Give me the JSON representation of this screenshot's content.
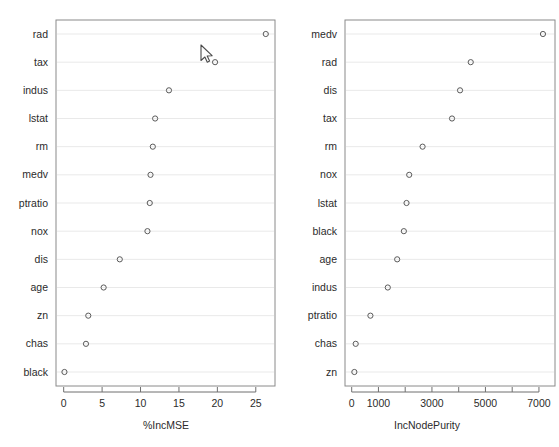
{
  "figure": {
    "type": "variable-importance-dotplot",
    "background_color": "#ffffff",
    "point_color": "#5a5a5a",
    "grid_color": "#e9e9e9",
    "axis_color": "#6f6f6f",
    "panel_count": 2
  },
  "cursor": {
    "name": "arrow-cursor",
    "x": 201,
    "y": 45
  },
  "chart_data": [
    {
      "id": "panel-left",
      "type": "scatter",
      "title": "",
      "xlabel": "%IncMSE",
      "ylabel": "",
      "xlim": [
        -1.0,
        27.5
      ],
      "ylim": [
        0,
        14
      ],
      "grid": true,
      "legend": false,
      "xticks": [
        0,
        5,
        10,
        15,
        20,
        25
      ],
      "xtick_labels": [
        "0",
        "5",
        "10",
        "15",
        "20",
        "25"
      ],
      "categories": [
        "rad",
        "tax",
        "indus",
        "lstat",
        "rm",
        "medv",
        "ptratio",
        "nox",
        "dis",
        "age",
        "zn",
        "chas",
        "black"
      ],
      "values": [
        26.3,
        19.7,
        13.7,
        11.9,
        11.6,
        11.3,
        11.2,
        10.9,
        7.3,
        5.2,
        3.2,
        2.9,
        0.1
      ]
    },
    {
      "id": "panel-right",
      "type": "scatter",
      "title": "",
      "xlabel": "IncNodePurity",
      "ylabel": "",
      "xlim": [
        -250,
        7600
      ],
      "ylim": [
        0,
        14
      ],
      "grid": true,
      "legend": false,
      "xticks": [
        0,
        1000,
        2000,
        3000,
        4000,
        5000,
        6000,
        7000
      ],
      "xtick_labels": [
        "0",
        "1000",
        "",
        "3000",
        "",
        "5000",
        "",
        "7000"
      ],
      "categories": [
        "medv",
        "rad",
        "dis",
        "tax",
        "rm",
        "nox",
        "lstat",
        "black",
        "age",
        "indus",
        "ptratio",
        "chas",
        "zn"
      ],
      "values": [
        7150,
        4450,
        4050,
        3750,
        2650,
        2150,
        2050,
        1950,
        1700,
        1350,
        700,
        150,
        100
      ]
    }
  ]
}
